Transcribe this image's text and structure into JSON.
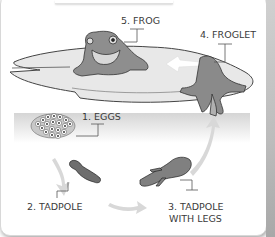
{
  "diagram": {
    "type": "life-cycle",
    "subject": "frog",
    "stages": [
      {
        "id": 1,
        "label": "1. EGGS"
      },
      {
        "id": 2,
        "label": "2. TADPOLE"
      },
      {
        "id": 3,
        "label_line1": "3. TADPOLE",
        "label_line2": "WITH LEGS"
      },
      {
        "id": 4,
        "label": "4. FROGLET"
      },
      {
        "id": 5,
        "label": "5. FROG"
      }
    ],
    "colors": {
      "background": "#ffffff",
      "animal": "#8a8a8a",
      "lily_pad": "#e6e6e6",
      "arrow": "#d9d9d9",
      "text": "#3a3a3a"
    }
  }
}
